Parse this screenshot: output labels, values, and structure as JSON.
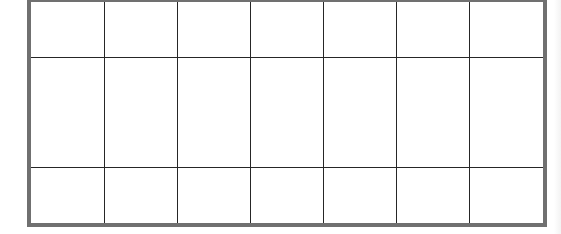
{
  "grid": {
    "rows": 3,
    "columns": 7,
    "cells": [
      [
        "",
        "",
        "",
        "",
        "",
        "",
        ""
      ],
      [
        "",
        "",
        "",
        "",
        "",
        "",
        ""
      ],
      [
        "",
        "",
        "",
        "",
        "",
        "",
        ""
      ]
    ],
    "colors": {
      "outer_border": "#707070",
      "inner_lines": "#262626",
      "background": "#ffffff"
    }
  }
}
